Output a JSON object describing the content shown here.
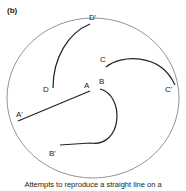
{
  "panel_label": "(b)",
  "points": {
    "A": "A",
    "A_prime": "A'",
    "B": "B",
    "B_prime": "B'",
    "C": "C",
    "C_prime": "C'",
    "D": "D",
    "D_prime": "D'"
  },
  "caption": "Attempts to reproduce a straight line on a",
  "colors": {
    "circle": "#777777",
    "stroke": "#222222"
  }
}
